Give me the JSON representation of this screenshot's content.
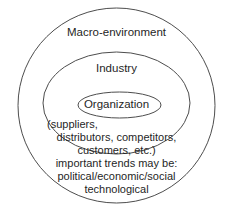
{
  "figure": {
    "type": "concentric-ellipse-diagram",
    "background_color": "#ffffff",
    "stroke_color": "#4d4d4d",
    "text_color": "#1f1f1f",
    "rings": [
      {
        "name": "macro-environment",
        "label": "Macro-environment",
        "cx": 116.5,
        "cy": 105.5,
        "rx": 98.5,
        "ry": 97.5
      },
      {
        "name": "industry",
        "label": "Industry",
        "cx": 116.5,
        "cy": 103,
        "rx": 73.5,
        "ry": 51
      },
      {
        "name": "organization",
        "label": "Organization",
        "cx": 119.5,
        "cy": 105,
        "rx": 41.5,
        "ry": 13
      }
    ]
  },
  "labels": {
    "macro": "Macro-environment",
    "industry": "Industry",
    "organization": "Organization"
  },
  "actors_note": {
    "line1": "(suppliers,",
    "line2": "distributors, competitors,",
    "line3": "customers, etc.)"
  },
  "trends_note": {
    "line1": "important trends may be:",
    "line2": "political/economic/social",
    "line3": "technological"
  }
}
